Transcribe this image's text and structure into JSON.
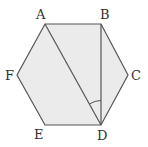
{
  "diagram": {
    "type": "regular-hexagon",
    "fill": "#ebebeb",
    "stroke": "#555555",
    "vertices": [
      {
        "label": "A",
        "x": 45,
        "y": 24
      },
      {
        "label": "B",
        "x": 101,
        "y": 24
      },
      {
        "label": "C",
        "x": 128,
        "y": 75
      },
      {
        "label": "D",
        "x": 101,
        "y": 125
      },
      {
        "label": "E",
        "x": 45,
        "y": 125
      },
      {
        "label": "F",
        "x": 17,
        "y": 75
      }
    ],
    "segments": [
      [
        "A",
        "D"
      ],
      [
        "B",
        "D"
      ]
    ],
    "angle_marker": {
      "at": "D",
      "between": [
        "A",
        "B"
      ]
    }
  }
}
